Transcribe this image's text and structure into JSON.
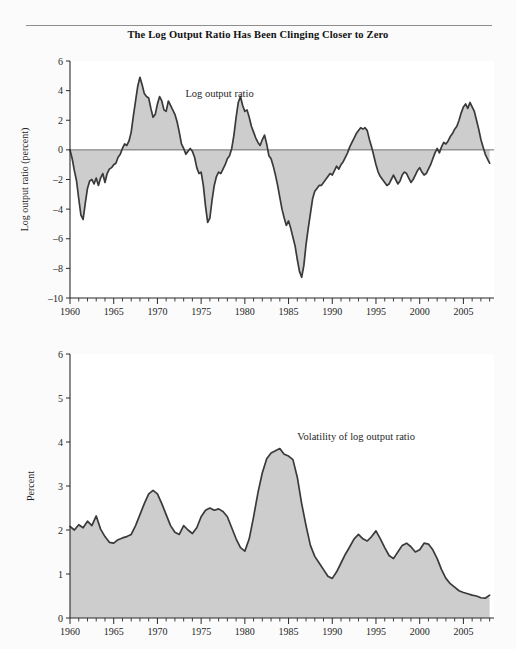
{
  "figure": {
    "title": "The Log Output Ratio Has Been Clinging Closer to Zero",
    "background_color": "#fbfbfb",
    "rule_color": "#8e8e8e"
  },
  "colors": {
    "area_fill": "#c9c9c9",
    "line": "#3a3a3a",
    "axis": "#2b2b2b",
    "zero_line": "#6d6d6d",
    "plot_background": "#ffffff",
    "text": "#1f1f1f"
  },
  "chart_data": [
    {
      "type": "area",
      "id": "log-output-ratio",
      "title": "",
      "xlabel": "",
      "ylabel": "Log output ratio (percent)",
      "annotation": "Log output ratio",
      "annotation_x": 1973.2,
      "annotation_y": 3.6,
      "xlim": [
        1960,
        2008.5
      ],
      "ylim": [
        -10,
        6
      ],
      "ytick_values": [
        -10,
        -8,
        -6,
        -4,
        -2,
        0,
        2,
        4,
        6
      ],
      "ytick_labels": [
        "–10",
        "–8",
        "–6",
        "–4",
        "–2",
        "0",
        "2",
        "4",
        "6"
      ],
      "xtick_major": [
        1960,
        1965,
        1970,
        1975,
        1980,
        1985,
        1990,
        1995,
        2000,
        2005
      ],
      "xtick_major_labels": [
        "1960",
        "1965",
        "1970",
        "1975",
        "1980",
        "1985",
        "1990",
        "1995",
        "2000",
        "2005"
      ],
      "xtick_minor_step": 1,
      "grid": false,
      "baseline": 0,
      "x": [
        1960.0,
        1960.25,
        1960.5,
        1960.75,
        1961.0,
        1961.25,
        1961.5,
        1961.75,
        1962.0,
        1962.25,
        1962.5,
        1962.75,
        1963.0,
        1963.25,
        1963.5,
        1963.75,
        1964.0,
        1964.25,
        1964.5,
        1964.75,
        1965.0,
        1965.25,
        1965.5,
        1965.75,
        1966.0,
        1966.25,
        1966.5,
        1966.75,
        1967.0,
        1967.25,
        1967.5,
        1967.75,
        1968.0,
        1968.25,
        1968.5,
        1968.75,
        1969.0,
        1969.25,
        1969.5,
        1969.75,
        1970.0,
        1970.25,
        1970.5,
        1970.75,
        1971.0,
        1971.25,
        1971.5,
        1971.75,
        1972.0,
        1972.25,
        1972.5,
        1972.75,
        1973.0,
        1973.25,
        1973.5,
        1973.75,
        1974.0,
        1974.25,
        1974.5,
        1974.75,
        1975.0,
        1975.25,
        1975.5,
        1975.75,
        1976.0,
        1976.25,
        1976.5,
        1976.75,
        1977.0,
        1977.25,
        1977.5,
        1977.75,
        1978.0,
        1978.25,
        1978.5,
        1978.75,
        1979.0,
        1979.25,
        1979.5,
        1979.75,
        1980.0,
        1980.25,
        1980.5,
        1980.75,
        1981.0,
        1981.25,
        1981.5,
        1981.75,
        1982.0,
        1982.25,
        1982.5,
        1982.75,
        1983.0,
        1983.25,
        1983.5,
        1983.75,
        1984.0,
        1984.25,
        1984.5,
        1984.75,
        1985.0,
        1985.25,
        1985.5,
        1985.75,
        1986.0,
        1986.25,
        1986.5,
        1986.75,
        1987.0,
        1987.25,
        1987.5,
        1987.75,
        1988.0,
        1988.25,
        1988.5,
        1988.75,
        1989.0,
        1989.25,
        1989.5,
        1989.75,
        1990.0,
        1990.25,
        1990.5,
        1990.75,
        1991.0,
        1991.25,
        1991.5,
        1991.75,
        1992.0,
        1992.25,
        1992.5,
        1992.75,
        1993.0,
        1993.25,
        1993.5,
        1993.75,
        1994.0,
        1994.25,
        1994.5,
        1994.75,
        1995.0,
        1995.25,
        1995.5,
        1995.75,
        1996.0,
        1996.25,
        1996.5,
        1996.75,
        1997.0,
        1997.25,
        1997.5,
        1997.75,
        1998.0,
        1998.25,
        1998.5,
        1998.75,
        1999.0,
        1999.25,
        1999.5,
        1999.75,
        2000.0,
        2000.25,
        2000.5,
        2000.75,
        2001.0,
        2001.25,
        2001.5,
        2001.75,
        2002.0,
        2002.25,
        2002.5,
        2002.75,
        2003.0,
        2003.25,
        2003.5,
        2003.75,
        2004.0,
        2004.25,
        2004.5,
        2004.75,
        2005.0,
        2005.25,
        2005.5,
        2005.75,
        2006.0,
        2006.25,
        2006.5,
        2006.75,
        2007.0,
        2007.25,
        2007.5,
        2007.75,
        2008.0
      ],
      "y": [
        0.0,
        -0.6,
        -1.4,
        -2.1,
        -3.3,
        -4.4,
        -4.7,
        -3.6,
        -2.6,
        -2.1,
        -2.0,
        -2.3,
        -1.9,
        -2.4,
        -1.9,
        -1.6,
        -2.2,
        -1.6,
        -1.3,
        -1.2,
        -1.0,
        -0.9,
        -0.5,
        -0.3,
        0.1,
        0.4,
        0.3,
        0.6,
        1.2,
        2.3,
        3.3,
        4.3,
        4.9,
        4.4,
        3.8,
        3.6,
        3.5,
        2.8,
        2.2,
        2.4,
        3.1,
        3.6,
        3.3,
        2.7,
        2.6,
        3.3,
        3.0,
        2.7,
        2.4,
        1.9,
        1.2,
        0.4,
        0.1,
        -0.3,
        -0.1,
        0.1,
        -0.1,
        -0.5,
        -1.2,
        -1.6,
        -1.5,
        -2.4,
        -3.8,
        -4.9,
        -4.6,
        -3.4,
        -2.4,
        -1.8,
        -1.5,
        -1.6,
        -1.3,
        -1.0,
        -0.6,
        -0.4,
        0.1,
        1.0,
        2.2,
        3.2,
        3.6,
        3.0,
        2.6,
        2.7,
        2.2,
        1.6,
        1.2,
        0.8,
        0.5,
        0.3,
        0.7,
        1.0,
        0.4,
        -0.4,
        -0.6,
        -1.1,
        -1.7,
        -2.4,
        -3.2,
        -4.0,
        -4.6,
        -5.1,
        -4.8,
        -5.3,
        -5.9,
        -6.5,
        -7.4,
        -8.2,
        -8.6,
        -7.8,
        -6.4,
        -5.3,
        -4.3,
        -3.3,
        -2.8,
        -2.6,
        -2.4,
        -2.4,
        -2.2,
        -2.0,
        -1.8,
        -1.6,
        -1.7,
        -1.4,
        -1.1,
        -1.3,
        -1.0,
        -0.8,
        -0.5,
        -0.2,
        0.2,
        0.5,
        0.8,
        1.1,
        1.3,
        1.5,
        1.4,
        1.5,
        1.3,
        0.7,
        0.2,
        -0.4,
        -1.0,
        -1.5,
        -1.8,
        -2.0,
        -2.2,
        -2.4,
        -2.3,
        -2.0,
        -1.7,
        -2.0,
        -2.3,
        -2.1,
        -1.7,
        -1.5,
        -1.6,
        -1.9,
        -2.2,
        -2.0,
        -1.7,
        -1.4,
        -1.2,
        -1.5,
        -1.7,
        -1.6,
        -1.3,
        -1.0,
        -0.6,
        -0.2,
        0.1,
        -0.2,
        0.2,
        0.5,
        0.4,
        0.6,
        0.9,
        1.1,
        1.4,
        1.6,
        2.0,
        2.5,
        2.9,
        3.1,
        2.8,
        3.2,
        2.9,
        2.6,
        2.0,
        1.4,
        0.7,
        0.2,
        -0.3,
        -0.6,
        -0.9,
        -1.2,
        -1.5,
        -1.2,
        -0.9,
        -0.7,
        -0.6,
        -0.4,
        -0.3,
        -0.2,
        -0.1,
        0.0,
        0.2,
        0.5,
        0.4,
        0.6,
        0.5,
        0.3,
        0.2,
        0.4,
        0.6,
        0.5,
        0.3,
        0.0,
        -0.4,
        -0.2,
        0.2,
        0.4,
        0.1,
        -0.3,
        -0.1,
        0.1,
        -0.2
      ]
    },
    {
      "type": "area",
      "id": "volatility-of-log-output-ratio",
      "title": "",
      "xlabel": "",
      "ylabel": "Percent",
      "annotation": "Volatility of log output ratio",
      "annotation_x": 1986.0,
      "annotation_y": 4.05,
      "xlim": [
        1960,
        2008.5
      ],
      "ylim": [
        0,
        6
      ],
      "ytick_values": [
        0,
        1,
        2,
        3,
        4,
        5,
        6
      ],
      "ytick_labels": [
        "0",
        "1",
        "2",
        "3",
        "4",
        "5",
        "6"
      ],
      "xtick_major": [
        1960,
        1965,
        1970,
        1975,
        1980,
        1985,
        1990,
        1995,
        2000,
        2005
      ],
      "xtick_major_labels": [
        "1960",
        "1965",
        "1970",
        "1975",
        "1980",
        "1985",
        "1990",
        "1995",
        "2000",
        "2005"
      ],
      "xtick_minor_step": 1,
      "grid": false,
      "baseline": 0,
      "x": [
        1960.0,
        1960.5,
        1961.0,
        1961.5,
        1962.0,
        1962.5,
        1963.0,
        1963.5,
        1964.0,
        1964.5,
        1965.0,
        1965.5,
        1966.0,
        1966.5,
        1967.0,
        1967.5,
        1968.0,
        1968.5,
        1969.0,
        1969.5,
        1970.0,
        1970.5,
        1971.0,
        1971.5,
        1972.0,
        1972.5,
        1973.0,
        1973.5,
        1974.0,
        1974.5,
        1975.0,
        1975.5,
        1976.0,
        1976.5,
        1977.0,
        1977.5,
        1978.0,
        1978.5,
        1979.0,
        1979.5,
        1980.0,
        1980.5,
        1981.0,
        1981.5,
        1982.0,
        1982.5,
        1983.0,
        1983.5,
        1984.0,
        1984.5,
        1985.0,
        1985.5,
        1986.0,
        1986.5,
        1987.0,
        1987.5,
        1988.0,
        1988.5,
        1989.0,
        1989.5,
        1990.0,
        1990.5,
        1991.0,
        1991.5,
        1992.0,
        1992.5,
        1993.0,
        1993.5,
        1994.0,
        1994.5,
        1995.0,
        1995.5,
        1996.0,
        1996.5,
        1997.0,
        1997.5,
        1998.0,
        1998.5,
        1999.0,
        1999.5,
        2000.0,
        2000.5,
        2001.0,
        2001.5,
        2002.0,
        2002.5,
        2003.0,
        2003.5,
        2004.0,
        2004.5,
        2005.0,
        2005.5,
        2006.0,
        2006.5,
        2007.0,
        2007.5,
        2008.0
      ],
      "y": [
        2.08,
        2.0,
        2.12,
        2.05,
        2.2,
        2.1,
        2.32,
        2.02,
        1.85,
        1.72,
        1.7,
        1.78,
        1.82,
        1.85,
        1.9,
        2.1,
        2.35,
        2.6,
        2.82,
        2.9,
        2.82,
        2.6,
        2.35,
        2.1,
        1.95,
        1.9,
        2.1,
        2.0,
        1.92,
        2.05,
        2.3,
        2.45,
        2.5,
        2.45,
        2.48,
        2.42,
        2.3,
        2.05,
        1.8,
        1.6,
        1.52,
        1.8,
        2.3,
        2.85,
        3.3,
        3.62,
        3.75,
        3.8,
        3.85,
        3.72,
        3.68,
        3.6,
        3.2,
        2.6,
        2.1,
        1.65,
        1.4,
        1.25,
        1.1,
        0.95,
        0.9,
        1.05,
        1.25,
        1.45,
        1.62,
        1.8,
        1.9,
        1.8,
        1.75,
        1.85,
        1.98,
        1.8,
        1.6,
        1.42,
        1.35,
        1.5,
        1.65,
        1.7,
        1.62,
        1.5,
        1.55,
        1.7,
        1.68,
        1.55,
        1.35,
        1.1,
        0.9,
        0.78,
        0.7,
        0.62,
        0.58,
        0.55,
        0.52,
        0.5,
        0.46,
        0.45,
        0.52
      ]
    }
  ]
}
